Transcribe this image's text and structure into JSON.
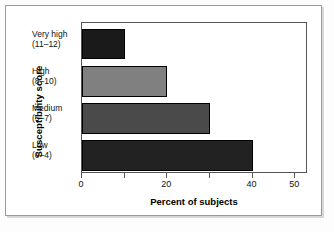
{
  "chart_data": {
    "type": "bar",
    "orientation": "horizontal",
    "title": "",
    "xlabel": "Percent of subjects",
    "ylabel": "Susceptibility score",
    "categories": [
      "Very high\n(11–12)",
      "High\n(8–10)",
      "Medium\n(5–7)",
      "Low\n(0–4)"
    ],
    "category_lines": [
      {
        "line1": "Very high",
        "line2": "(11–12)"
      },
      {
        "line1": "High",
        "line2": "(8–10)"
      },
      {
        "line1": "Medium",
        "line2": "(5–7)"
      },
      {
        "line1": "Low",
        "line2": "(0–4)"
      }
    ],
    "values": [
      10,
      20,
      30,
      40
    ],
    "bar_colors": [
      "#1a1a1a",
      "#808080",
      "#4a4a4a",
      "#222222"
    ],
    "xlim": [
      0,
      53
    ],
    "xticks": [
      0,
      10,
      20,
      30,
      40,
      50
    ],
    "xtick_labels": [
      "0",
      "",
      "20",
      "",
      "40",
      "50"
    ],
    "grid": false,
    "legend": "none"
  },
  "axis": {
    "x_title": "Percent of subjects",
    "y_title": "Susceptibility score"
  },
  "ticks": [
    {
      "value": 0,
      "label": "0"
    },
    {
      "value": 10,
      "label": ""
    },
    {
      "value": 20,
      "label": "20"
    },
    {
      "value": 30,
      "label": ""
    },
    {
      "value": 40,
      "label": "40"
    },
    {
      "value": 50,
      "label": "50"
    }
  ]
}
